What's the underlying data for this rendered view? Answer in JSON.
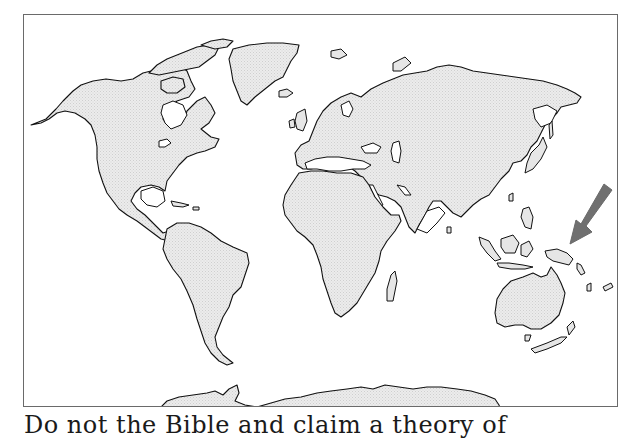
{
  "figure": {
    "type": "world-map-outline",
    "projection": "equirectangular-style world map",
    "land_fill": "#e8e8e8",
    "outline_color": "#111111",
    "frame_color": "#6a6a6a",
    "background": "#ffffff"
  },
  "annotation": {
    "icon": "arrow-icon",
    "direction": "pointing down-left",
    "target_region": "New Guinea / western Pacific",
    "color": "#707070"
  },
  "regions": [
    {
      "name": "North America"
    },
    {
      "name": "Greenland"
    },
    {
      "name": "South America"
    },
    {
      "name": "Europe"
    },
    {
      "name": "Africa"
    },
    {
      "name": "Asia"
    },
    {
      "name": "Australia"
    },
    {
      "name": "New Zealand"
    },
    {
      "name": "Antarctica"
    }
  ],
  "caption": {
    "text": "Do not the Bible and claim a theory of"
  }
}
